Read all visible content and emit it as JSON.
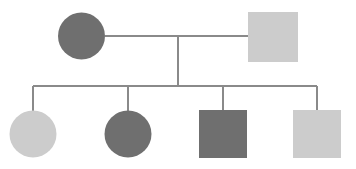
{
  "canvas": {
    "width": 356,
    "height": 169,
    "background": "#ffffff",
    "title": "Pedigree Chart"
  },
  "palette": {
    "affected_dark": "#6f6f6f",
    "unaffected_light": "#cccccc",
    "line": "#8a8a8a",
    "background": "#ffffff"
  },
  "chart_data": {
    "type": "diagram",
    "diagram_type": "pedigree",
    "legend": [
      {
        "symbol": "circle",
        "meaning": "female"
      },
      {
        "symbol": "square",
        "meaning": "male"
      },
      {
        "symbol": "dark-fill",
        "meaning": "affected"
      },
      {
        "symbol": "light-fill",
        "meaning": "unaffected"
      }
    ],
    "generations": [
      {
        "label": "I",
        "individuals": [
          {
            "id": "I-1",
            "shape": "circle",
            "sex": "female",
            "fill": "#6f6f6f",
            "status": "affected",
            "cx": 81.5,
            "cy": 36,
            "r": 23.5
          },
          {
            "id": "I-2",
            "shape": "square",
            "sex": "male",
            "fill": "#cccccc",
            "status": "unaffected",
            "x": 248,
            "y": 12,
            "size": 50
          }
        ]
      },
      {
        "label": "II",
        "individuals": [
          {
            "id": "II-1",
            "shape": "circle",
            "sex": "female",
            "fill": "#cccccc",
            "status": "unaffected",
            "cx": 33,
            "cy": 134,
            "r": 23.5
          },
          {
            "id": "II-2",
            "shape": "circle",
            "sex": "female",
            "fill": "#6f6f6f",
            "status": "affected",
            "cx": 128,
            "cy": 134,
            "r": 23.5
          },
          {
            "id": "II-3",
            "shape": "square",
            "sex": "male",
            "fill": "#6f6f6f",
            "status": "affected",
            "x": 199,
            "y": 110,
            "size": 48
          },
          {
            "id": "II-4",
            "shape": "square",
            "sex": "male",
            "fill": "#cccccc",
            "status": "unaffected",
            "x": 293,
            "y": 110,
            "size": 48
          }
        ]
      }
    ],
    "connections": {
      "mating_line": {
        "x1": 105,
        "y1": 36,
        "x2": 248,
        "y2": 36
      },
      "descent_line": {
        "x1": 178,
        "y1": 36,
        "x2": 178,
        "y2": 86
      },
      "sibship_line": {
        "x1": 33,
        "y1": 86,
        "x2": 317,
        "y2": 86
      },
      "child_drops": [
        {
          "x": 33,
          "y1": 86,
          "y2": 111
        },
        {
          "x": 128,
          "y1": 86,
          "y2": 111
        },
        {
          "x": 223,
          "y1": 86,
          "y2": 110
        },
        {
          "x": 317,
          "y1": 86,
          "y2": 110
        }
      ]
    },
    "counts": {
      "parents": 2,
      "children": 4,
      "affected": 3,
      "unaffected": 3
    }
  }
}
